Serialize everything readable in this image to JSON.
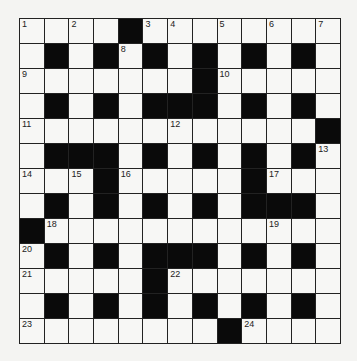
{
  "puzzle": {
    "rows": 13,
    "cols": 13,
    "grid": [
      "....#........",
      ".#.#.#.#.#.#.",
      ".......#.....",
      ".#.#.###.#.#.",
      "............#",
      ".###.#.#.#.#.",
      "...#.....#...",
      ".#.#.#.#.###.",
      "#............",
      ".#.#.###.#.#.",
      ".....#.......",
      ".#.#.#.#.#.#.",
      "........#...."
    ],
    "numbers": [
      {
        "r": 0,
        "c": 0,
        "n": "1"
      },
      {
        "r": 0,
        "c": 2,
        "n": "2"
      },
      {
        "r": 0,
        "c": 5,
        "n": "3"
      },
      {
        "r": 0,
        "c": 6,
        "n": "4"
      },
      {
        "r": 0,
        "c": 8,
        "n": "5"
      },
      {
        "r": 0,
        "c": 10,
        "n": "6"
      },
      {
        "r": 0,
        "c": 12,
        "n": "7"
      },
      {
        "r": 1,
        "c": 4,
        "n": "8"
      },
      {
        "r": 2,
        "c": 0,
        "n": "9"
      },
      {
        "r": 2,
        "c": 8,
        "n": "10"
      },
      {
        "r": 4,
        "c": 0,
        "n": "11"
      },
      {
        "r": 4,
        "c": 6,
        "n": "12"
      },
      {
        "r": 5,
        "c": 12,
        "n": "13"
      },
      {
        "r": 6,
        "c": 0,
        "n": "14"
      },
      {
        "r": 6,
        "c": 2,
        "n": "15"
      },
      {
        "r": 6,
        "c": 4,
        "n": "16"
      },
      {
        "r": 6,
        "c": 10,
        "n": "17"
      },
      {
        "r": 8,
        "c": 1,
        "n": "18"
      },
      {
        "r": 8,
        "c": 10,
        "n": "19"
      },
      {
        "r": 9,
        "c": 0,
        "n": "20"
      },
      {
        "r": 10,
        "c": 0,
        "n": "21"
      },
      {
        "r": 10,
        "c": 6,
        "n": "22"
      },
      {
        "r": 12,
        "c": 0,
        "n": "23"
      },
      {
        "r": 12,
        "c": 9,
        "n": "24"
      }
    ]
  }
}
